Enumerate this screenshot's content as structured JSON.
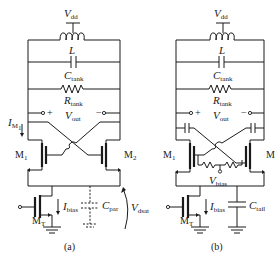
{
  "figure": {
    "panels": [
      {
        "id": "a",
        "caption": "(a)",
        "labels": {
          "vdd": {
            "main": "V",
            "sub": "dd"
          },
          "inductor": {
            "main": "L",
            "sub": ""
          },
          "c_tank": {
            "main": "C",
            "sub": "tank"
          },
          "r_tank": {
            "main": "R",
            "sub": "tank"
          },
          "v_out": {
            "main": "V",
            "sub": "out"
          },
          "plus": "+",
          "minus": "−",
          "i_m1": {
            "main": "I",
            "sub": "M"
          },
          "i_m1_subsub": "1",
          "m1": {
            "main": "M",
            "sub": "1"
          },
          "m2": {
            "main": "M",
            "sub": "2"
          },
          "mt": {
            "main": "M",
            "sub": "T"
          },
          "i_bias": {
            "main": "I",
            "sub": "bias"
          },
          "c_par": {
            "main": "C",
            "sub": "par"
          },
          "v_dsat": {
            "main": "V",
            "sub": "dsat"
          }
        }
      },
      {
        "id": "b",
        "caption": "(b)",
        "labels": {
          "vdd": {
            "main": "V",
            "sub": "dd"
          },
          "inductor": {
            "main": "L",
            "sub": ""
          },
          "c_tank": {
            "main": "C",
            "sub": "tank"
          },
          "r_tank": {
            "main": "R",
            "sub": "tank"
          },
          "v_out": {
            "main": "V",
            "sub": "out"
          },
          "plus": "+",
          "minus": "−",
          "m1": {
            "main": "M",
            "sub": "1"
          },
          "m2": {
            "main": "M",
            "sub": "2"
          },
          "mt": {
            "main": "M",
            "sub": "T"
          },
          "v_bias": {
            "main": "V",
            "sub": "bias"
          },
          "i_bias": {
            "main": "I",
            "sub": "bias"
          },
          "c_tail": {
            "main": "C",
            "sub": "tail"
          }
        }
      }
    ]
  }
}
